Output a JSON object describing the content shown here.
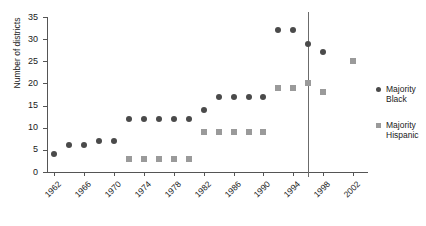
{
  "chart_data": {
    "type": "scatter",
    "title": "",
    "xlabel": "",
    "ylabel": "Number of districts",
    "xlim": [
      1961,
      2004
    ],
    "ylim": [
      0,
      35
    ],
    "ytick_values": [
      0,
      5,
      10,
      15,
      20,
      25,
      30,
      35
    ],
    "ytick_labels": [
      "0",
      "5",
      "10",
      "15",
      "20",
      "25",
      "30",
      "35"
    ],
    "xtick_values": [
      1962,
      1966,
      1970,
      1974,
      1978,
      1982,
      1986,
      1990,
      1994,
      1998,
      2002
    ],
    "xtick_labels": [
      "1962",
      "1966",
      "1970",
      "1974",
      "1978",
      "1982",
      "1986",
      "1990",
      "1994",
      "1998",
      "2002"
    ],
    "grid": false,
    "legend_position": "right",
    "annotations": [
      {
        "name": "vertical-reference-line",
        "type": "vline",
        "x": 1996
      }
    ],
    "series": [
      {
        "name": "Majority Black",
        "marker": "circle",
        "color": "#4a4a4a",
        "points": [
          {
            "x": 1962,
            "y": 4
          },
          {
            "x": 1964,
            "y": 6
          },
          {
            "x": 1966,
            "y": 6
          },
          {
            "x": 1968,
            "y": 7
          },
          {
            "x": 1970,
            "y": 7
          },
          {
            "x": 1972,
            "y": 12
          },
          {
            "x": 1974,
            "y": 12
          },
          {
            "x": 1976,
            "y": 12
          },
          {
            "x": 1978,
            "y": 12
          },
          {
            "x": 1980,
            "y": 12
          },
          {
            "x": 1982,
            "y": 14
          },
          {
            "x": 1984,
            "y": 17
          },
          {
            "x": 1986,
            "y": 17
          },
          {
            "x": 1988,
            "y": 17
          },
          {
            "x": 1990,
            "y": 17
          },
          {
            "x": 1992,
            "y": 32
          },
          {
            "x": 1994,
            "y": 32
          },
          {
            "x": 1996,
            "y": 29
          },
          {
            "x": 1998,
            "y": 27
          }
        ]
      },
      {
        "name": "Majority Hispanic",
        "marker": "square",
        "color": "#9a9a9a",
        "points": [
          {
            "x": 1972,
            "y": 3
          },
          {
            "x": 1974,
            "y": 3
          },
          {
            "x": 1976,
            "y": 3
          },
          {
            "x": 1978,
            "y": 3
          },
          {
            "x": 1980,
            "y": 3
          },
          {
            "x": 1982,
            "y": 9
          },
          {
            "x": 1984,
            "y": 9
          },
          {
            "x": 1986,
            "y": 9
          },
          {
            "x": 1988,
            "y": 9
          },
          {
            "x": 1990,
            "y": 9
          },
          {
            "x": 1992,
            "y": 19
          },
          {
            "x": 1994,
            "y": 19
          },
          {
            "x": 1996,
            "y": 20
          },
          {
            "x": 1998,
            "y": 18
          },
          {
            "x": 2002,
            "y": 25
          }
        ]
      }
    ]
  },
  "legend": {
    "entries": [
      {
        "label": "Majority\nBlack",
        "marker": "circle"
      },
      {
        "label": "Majority\nHispanic",
        "marker": "square"
      }
    ]
  },
  "colors": {
    "majority_black": "#4a4a4a",
    "majority_hispanic": "#9a9a9a",
    "axis": "#555555",
    "reference_line": "#6b6b6b"
  }
}
